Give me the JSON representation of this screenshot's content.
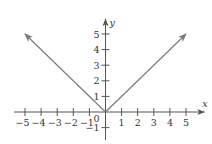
{
  "chart_data": {
    "type": "line",
    "title": "",
    "function": "y = |x|",
    "xlabel": "x",
    "ylabel": "y",
    "xlim": [
      -5.8,
      6.2
    ],
    "ylim": [
      -1.6,
      6.2
    ],
    "grid": false,
    "legend": null,
    "x_ticks": [
      -5,
      -4,
      -3,
      -2,
      -1,
      1,
      2,
      3,
      4,
      5
    ],
    "x_tick_labels": [
      "−5",
      "−4",
      "−3",
      "−2",
      "−1",
      "1",
      "2",
      "3",
      "4",
      "5"
    ],
    "y_ticks": [
      -1,
      1,
      2,
      3,
      4,
      5
    ],
    "y_tick_labels": [
      "−1",
      "1",
      "2",
      "3",
      "4",
      "5"
    ],
    "origin_label": "0",
    "series": [
      {
        "name": "y = |x|",
        "x": [
          -5,
          -4,
          -3,
          -2,
          -1,
          0,
          1,
          2,
          3,
          4,
          5
        ],
        "y": [
          5,
          4,
          3,
          2,
          1,
          0,
          1,
          2,
          3,
          4,
          5
        ],
        "arrows_at_ends": true,
        "color": "#7a7a7a"
      }
    ]
  },
  "colors": {
    "axis": "#555555",
    "curve": "#7a7a7a",
    "text": "#333333"
  }
}
